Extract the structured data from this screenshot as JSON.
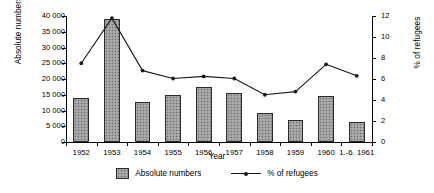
{
  "chart_data": {
    "type": "bar",
    "title": "",
    "subtitle": "",
    "xlabel": "Year",
    "ylabel": "Absolute numbers",
    "y2label": "% of refugees",
    "categories": [
      "1952",
      "1953",
      "1954",
      "1955",
      "1956",
      "1957",
      "1958",
      "1959",
      "1960",
      "1.-6. 1961"
    ],
    "series": [
      {
        "name": "Absolute numbers",
        "type": "bar",
        "axis": "left",
        "values": [
          14000,
          39200,
          12600,
          15000,
          17500,
          15600,
          9100,
          7100,
          14700,
          6300
        ]
      },
      {
        "name": "% of refugees",
        "type": "line",
        "axis": "right",
        "values": [
          7.5,
          11.8,
          6.8,
          6.05,
          6.25,
          6.05,
          4.5,
          4.8,
          7.4,
          6.3
        ]
      }
    ],
    "ylim": [
      0,
      40000
    ],
    "yticks": [
      0,
      5000,
      10000,
      15000,
      20000,
      25000,
      30000,
      35000,
      40000
    ],
    "ytick_labels": [
      "0",
      "5 000",
      "10 000",
      "15 000",
      "20 000",
      "25 000",
      "30 000",
      "35 000",
      "40 000"
    ],
    "y2lim": [
      0,
      12
    ],
    "y2ticks": [
      0,
      2,
      4,
      6,
      8,
      10,
      12
    ],
    "y2tick_labels": [
      "0",
      "2",
      "4",
      "6",
      "8",
      "10",
      "12"
    ],
    "grid": false,
    "legend_position": "bottom",
    "colors": {
      "bar_fill": "#9e9e9e",
      "bar_border": "#2b2b2b",
      "line": "#1a1a1a",
      "background": "#ffffff",
      "axis": "#000000"
    }
  },
  "legend": [
    {
      "label": "Absolute numbers",
      "marker": "filled-square-swatch"
    },
    {
      "label": "% of refugees",
      "marker": "line-with-dot"
    }
  ]
}
